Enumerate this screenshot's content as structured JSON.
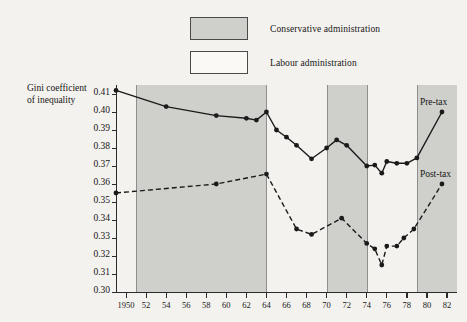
{
  "legend": {
    "items": [
      {
        "label": "Conservative administration",
        "swatch": "shaded",
        "color": "#cfcfcb"
      },
      {
        "label": "Labour administration",
        "swatch": "white",
        "color": "#ffffff"
      }
    ]
  },
  "axis_title": {
    "line1": "Gini coefficient",
    "line2": "of inequality"
  },
  "chart_data": {
    "type": "line",
    "title": "",
    "subtitle": "",
    "xlabel": "",
    "ylabel": "Gini coefficient of inequality",
    "xlim": [
      1949,
      1983
    ],
    "ylim": [
      0.3,
      0.415
    ],
    "grid": false,
    "legend_position": "top-center",
    "yticks": [
      "0.30",
      "0.31",
      "0.32",
      "0.33",
      "0.34",
      "0.35",
      "0.36",
      "0.37",
      "0.38",
      "0.39",
      "0.40",
      "0.41"
    ],
    "ytick_values": [
      0.3,
      0.31,
      0.32,
      0.33,
      0.34,
      0.35,
      0.36,
      0.37,
      0.38,
      0.39,
      0.4,
      0.41
    ],
    "xticks": [
      "1950",
      "52",
      "54",
      "56",
      "58",
      "60",
      "62",
      "64",
      "66",
      "68",
      "70",
      "72",
      "74",
      "76",
      "78",
      "80",
      "82"
    ],
    "xtick_values": [
      1950,
      1952,
      1954,
      1956,
      1958,
      1960,
      1962,
      1964,
      1966,
      1968,
      1970,
      1972,
      1974,
      1976,
      1978,
      1980,
      1982
    ],
    "series": [
      {
        "name": "Pre-tax",
        "style": "solid",
        "color": "#1a1a1a",
        "points": [
          {
            "x": 1949,
            "y": 0.412
          },
          {
            "x": 1954,
            "y": 0.403
          },
          {
            "x": 1959,
            "y": 0.398
          },
          {
            "x": 1962,
            "y": 0.3965
          },
          {
            "x": 1963,
            "y": 0.3955
          },
          {
            "x": 1964,
            "y": 0.4
          },
          {
            "x": 1965,
            "y": 0.39
          },
          {
            "x": 1966,
            "y": 0.386
          },
          {
            "x": 1967,
            "y": 0.3815
          },
          {
            "x": 1968.5,
            "y": 0.374
          },
          {
            "x": 1970,
            "y": 0.38
          },
          {
            "x": 1971,
            "y": 0.3845
          },
          {
            "x": 1972,
            "y": 0.3815
          },
          {
            "x": 1974,
            "y": 0.37
          },
          {
            "x": 1974.8,
            "y": 0.3705
          },
          {
            "x": 1975.5,
            "y": 0.366
          },
          {
            "x": 1976,
            "y": 0.3725
          },
          {
            "x": 1977,
            "y": 0.3715
          },
          {
            "x": 1978,
            "y": 0.3715
          },
          {
            "x": 1979,
            "y": 0.3745
          },
          {
            "x": 1981.5,
            "y": 0.4
          }
        ]
      },
      {
        "name": "Post-tax",
        "style": "dashed",
        "color": "#1a1a1a",
        "points": [
          {
            "x": 1949,
            "y": 0.355
          },
          {
            "x": 1959,
            "y": 0.36
          },
          {
            "x": 1964,
            "y": 0.3655
          },
          {
            "x": 1967,
            "y": 0.335
          },
          {
            "x": 1968.5,
            "y": 0.332
          },
          {
            "x": 1971.5,
            "y": 0.341
          },
          {
            "x": 1974,
            "y": 0.327
          },
          {
            "x": 1974.8,
            "y": 0.324
          },
          {
            "x": 1975.5,
            "y": 0.315
          },
          {
            "x": 1976,
            "y": 0.3255
          },
          {
            "x": 1977,
            "y": 0.3255
          },
          {
            "x": 1977.7,
            "y": 0.33
          },
          {
            "x": 1978.7,
            "y": 0.335
          },
          {
            "x": 1981.5,
            "y": 0.36
          }
        ]
      }
    ],
    "bands": [
      {
        "label": "Conservative administration",
        "x0": 1951,
        "x1": 1964,
        "fill": "#cfcfcb"
      },
      {
        "label": "Conservative administration",
        "x0": 1970,
        "x1": 1974,
        "fill": "#cfcfcb"
      },
      {
        "label": "Conservative administration",
        "x0": 1979,
        "x1": 1983,
        "fill": "#cfcfcb"
      }
    ],
    "annotations": [
      {
        "text": "Pre-tax",
        "x": 1979.3,
        "y": 0.4045
      },
      {
        "text": "Post-tax",
        "x": 1979.3,
        "y": 0.3645
      }
    ]
  }
}
